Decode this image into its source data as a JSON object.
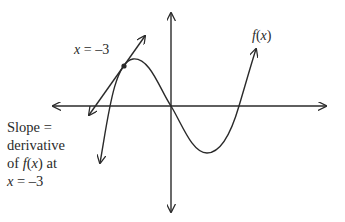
{
  "diagram": {
    "function_label": {
      "name": "f",
      "arg": "x"
    },
    "point_label": {
      "var": "x",
      "eq": " = ",
      "value": "–3"
    },
    "note": {
      "line1": "Slope =",
      "line2": "derivative",
      "line3_pre": "of ",
      "line3_f": "f",
      "line3_paren_open": "(",
      "line3_x": "x",
      "line3_paren_close": ")",
      "line3_post": " at",
      "line4_var": "x",
      "line4_rest": " = –3"
    },
    "colors": {
      "stroke": "#2a2a2a",
      "background": "#ffffff"
    },
    "elements": [
      "x-axis",
      "y-axis",
      "curve f(x)",
      "tangent line",
      "point of tangency"
    ]
  }
}
